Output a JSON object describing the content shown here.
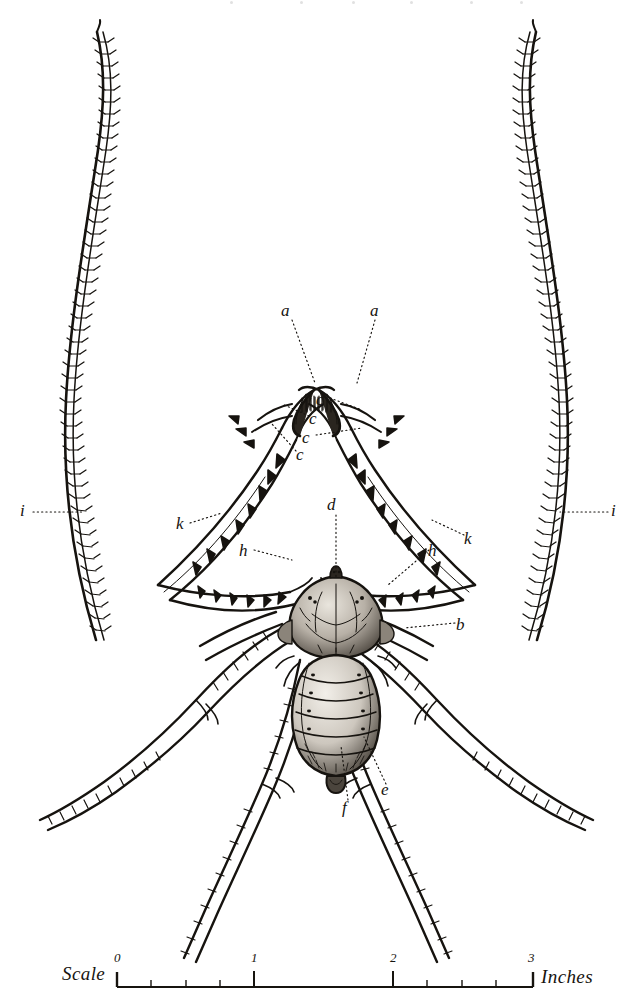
{
  "figure": {
    "background_color": "#ffffff",
    "ink_color": "#16130f",
    "organism": "whip spider"
  },
  "labels": [
    {
      "id": "a-left",
      "text": "a",
      "x": 285,
      "y": 311,
      "part": "chelicera-fang"
    },
    {
      "id": "a-right",
      "text": "a",
      "x": 374,
      "y": 311,
      "part": "chelicera-fang"
    },
    {
      "id": "c-1",
      "text": "c",
      "x": 320,
      "y": 400,
      "part": "pedipalp-spine"
    },
    {
      "id": "c-2",
      "text": "c",
      "x": 313,
      "y": 419,
      "part": "pedipalp-spine"
    },
    {
      "id": "c-3",
      "text": "c",
      "x": 306,
      "y": 438,
      "part": "pedipalp-spine"
    },
    {
      "id": "c-4",
      "text": "c",
      "x": 300,
      "y": 455,
      "part": "pedipalp-spine"
    },
    {
      "id": "d",
      "text": "d",
      "x": 331,
      "y": 505,
      "part": "median-eyes"
    },
    {
      "id": "h-left",
      "text": "h",
      "x": 243,
      "y": 551,
      "part": "pedipalp-femur"
    },
    {
      "id": "h-right",
      "text": "h",
      "x": 432,
      "y": 551,
      "part": "pedipalp-femur"
    },
    {
      "id": "k-left",
      "text": "k",
      "x": 180,
      "y": 524,
      "part": "pedipalp-tibia"
    },
    {
      "id": "k-right",
      "text": "k",
      "x": 468,
      "y": 539,
      "part": "pedipalp-tibia"
    },
    {
      "id": "i-left",
      "text": "i",
      "x": 24,
      "y": 511,
      "part": "antenniform-leg"
    },
    {
      "id": "i-right",
      "text": "i",
      "x": 615,
      "y": 511,
      "part": "antenniform-leg"
    },
    {
      "id": "b",
      "text": "b",
      "x": 460,
      "y": 625,
      "part": "lateral-eyes"
    },
    {
      "id": "e",
      "text": "e",
      "x": 385,
      "y": 790,
      "part": "walking-leg-coxa"
    },
    {
      "id": "f",
      "text": "f",
      "x": 346,
      "y": 808,
      "part": "abdomen-pedicel"
    }
  ],
  "leader_lines": [
    {
      "from": "a-left",
      "x1": 292,
      "y1": 320,
      "x2": 315,
      "y2": 383
    },
    {
      "from": "a-right",
      "x1": 375,
      "y1": 320,
      "x2": 357,
      "y2": 383
    },
    {
      "from": "c-1",
      "x1": 330,
      "y1": 398,
      "x2": 362,
      "y2": 410
    },
    {
      "from": "c-2",
      "x1": 309,
      "y1": 416,
      "x2": 282,
      "y2": 404
    },
    {
      "from": "c-3",
      "x1": 316,
      "y1": 435,
      "x2": 362,
      "y2": 428
    },
    {
      "from": "c-4",
      "x1": 296,
      "y1": 451,
      "x2": 272,
      "y2": 424
    },
    {
      "from": "d",
      "x1": 336,
      "y1": 515,
      "x2": 336,
      "y2": 578
    },
    {
      "from": "h-left",
      "x1": 254,
      "y1": 550,
      "x2": 292,
      "y2": 560
    },
    {
      "from": "h-right",
      "x1": 429,
      "y1": 550,
      "x2": 388,
      "y2": 585
    },
    {
      "from": "k-left",
      "x1": 190,
      "y1": 523,
      "x2": 222,
      "y2": 513
    },
    {
      "from": "k-right",
      "x1": 464,
      "y1": 535,
      "x2": 432,
      "y2": 520
    },
    {
      "from": "i-left",
      "x1": 33,
      "y1": 512,
      "x2": 83,
      "y2": 512
    },
    {
      "from": "i-right",
      "x1": 608,
      "y1": 512,
      "x2": 560,
      "y2": 512
    },
    {
      "from": "b",
      "x1": 455,
      "y1": 623,
      "x2": 404,
      "y2": 628
    },
    {
      "from": "e",
      "x1": 386,
      "y1": 784,
      "x2": 364,
      "y2": 737
    },
    {
      "from": "f",
      "x1": 348,
      "y1": 800,
      "x2": 341,
      "y2": 746
    }
  ],
  "scale": {
    "label_left": "Scale",
    "label_right": "Inches",
    "ticks": [
      {
        "value": "0",
        "x": 117
      },
      {
        "value": "1",
        "x": 254
      },
      {
        "value": "2",
        "x": 393
      },
      {
        "value": "3",
        "x": 531
      }
    ],
    "minor_ticks_x": [
      151,
      186,
      220,
      427,
      462,
      496
    ],
    "baseline_y": 987,
    "axis_start_x": 117,
    "axis_end_x": 533,
    "units": "Inches",
    "min": 0,
    "max": 3
  }
}
